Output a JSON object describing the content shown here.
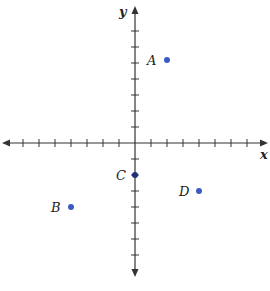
{
  "chart_data": {
    "type": "scatter",
    "title": "",
    "xlabel": "x",
    "ylabel": "y",
    "xlim": [
      -8,
      8
    ],
    "ylim": [
      -8,
      8
    ],
    "ticks_per_side": 7,
    "tick_labels": false,
    "grid": false,
    "points": [
      {
        "label": "A",
        "x": 2,
        "y": 5
      },
      {
        "label": "B",
        "x": -4,
        "y": -4
      },
      {
        "label": "C",
        "x": 0,
        "y": -2
      },
      {
        "label": "D",
        "x": 4,
        "y": -3
      }
    ]
  },
  "colors": {
    "point": "#3B5BC4",
    "axis": "#333333"
  },
  "axes": {
    "x_label": "x",
    "y_label": "y"
  },
  "points": {
    "A": "A",
    "B": "B",
    "C": "C",
    "D": "D"
  }
}
